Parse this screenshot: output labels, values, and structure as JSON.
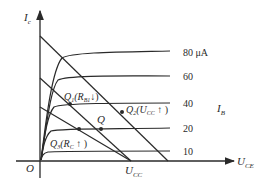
{
  "diagram": {
    "type": "transistor output characteristics with load lines",
    "axes": {
      "y_label_main": "I",
      "y_label_sub": "c",
      "x_label_main": "U",
      "x_label_sub": "CE",
      "origin": "O"
    },
    "curve_family_label_main": "I",
    "curve_family_label_sub": "B",
    "curves": [
      {
        "label": "80 μA",
        "level_y": 53
      },
      {
        "label": "60",
        "level_y": 77
      },
      {
        "label": "40",
        "level_y": 104
      },
      {
        "label": "20",
        "level_y": 129
      },
      {
        "label": "10",
        "level_y": 151
      }
    ],
    "load_lines": [
      {
        "name": "Uo-increased",
        "x1": 40,
        "y1": 36,
        "x2": 168,
        "y2": 161
      },
      {
        "name": "main",
        "x1": 40,
        "y1": 78,
        "x2": 131,
        "y2": 161
      },
      {
        "name": "Rc-increased",
        "x1": 40,
        "y1": 107,
        "x2": 131,
        "y2": 161
      }
    ],
    "points": [
      {
        "name": "Q",
        "label": "Q",
        "x": 101,
        "y": 129
      },
      {
        "name": "Q1",
        "label_main": "Q",
        "label_sub": "1",
        "label_rest": "(R",
        "label_rest_sub": "B1",
        "label_tail": "↓)",
        "x": 70,
        "y": 104
      },
      {
        "name": "Q2",
        "label_main": "Q",
        "label_sub": "2",
        "label_rest": "(U",
        "label_rest_sub": "CC",
        "label_tail": " ↑ )",
        "x": 122,
        "y": 112
      },
      {
        "name": "Q3",
        "label_main": "Q",
        "label_sub": "3",
        "label_rest": "(R",
        "label_rest_sub": "C",
        "label_tail": " ↑ )",
        "x": 79,
        "y": 129
      }
    ],
    "x_axis_marker": {
      "label_main": "U",
      "label_sub": "CC"
    },
    "colors": {
      "line": "#2a2a2a",
      "background": "#ffffff"
    }
  }
}
